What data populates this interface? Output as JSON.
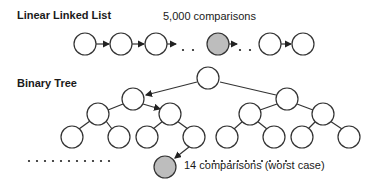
{
  "linked_list": {
    "title": "Linear Linked List",
    "annotation": "5,000 comparisons",
    "ellipsis": ". ."
  },
  "binary_tree": {
    "title": "Binary Tree",
    "annotation": "14 comparisons (worst case)",
    "ellipsis_left": ". . . . . . . . . . .",
    "ellipsis_right": ". . . . . . . . . . ."
  },
  "colors": {
    "node_fill": "#ffffff",
    "highlight_fill": "#bdbdbd",
    "stroke": "#333333"
  }
}
